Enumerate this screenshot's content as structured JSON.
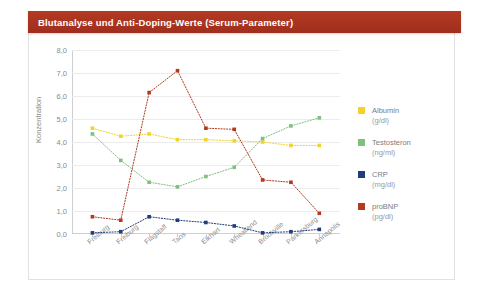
{
  "title": "Blutanalyse und Anti-Doping-Werte (Serum-Parameter)",
  "colors": {
    "title_bar": "#a93320",
    "albumin": "#f2d32e",
    "testosteron": "#7fc07f",
    "crp": "#1f3d7a",
    "probnp": "#b23a1e",
    "grid": "#ececec",
    "axis": "#cfcfcf",
    "tick_text": "#8a8a8a"
  },
  "legend": {
    "items": [
      {
        "label": "Albumin",
        "unit": "(g/dl)",
        "color": "#f2d32e",
        "swatch": "legend-swatch-albumin"
      },
      {
        "label": "Testosteron",
        "unit": "(ng/ml)",
        "color": "#7fc07f",
        "swatch": "legend-swatch-testosteron"
      },
      {
        "label": "CRP",
        "unit": "(mg/dl)",
        "color": "#1f3d7a",
        "swatch": "legend-swatch-crp"
      },
      {
        "label": "proBNP",
        "unit": "(pg/dl)",
        "color": "#b23a1e",
        "swatch": "legend-swatch-probnp"
      }
    ]
  },
  "chart_data": {
    "type": "line",
    "title": "Blutanalyse und Anti-Doping-Werte (Serum-Parameter)",
    "xlabel": "",
    "ylabel": "Konzentration",
    "ylim": [
      0,
      8
    ],
    "yticks": [
      0,
      1,
      2,
      3,
      4,
      5,
      6,
      7,
      8
    ],
    "ytick_labels": [
      "0,0",
      "1,0",
      "2,0",
      "3,0",
      "4,0",
      "5,0",
      "6,0",
      "7,0",
      "8,0"
    ],
    "grid": true,
    "legend_position": "right",
    "marker": "square",
    "linestyle": "dotted",
    "categories": [
      "Freiburg",
      "Freiburg",
      "Flagstaff",
      "Taos",
      "Elkhart",
      "Wheatland",
      "Brookville",
      "Parkersburg",
      "Annapolis"
    ],
    "series": [
      {
        "name": "Albumin",
        "unit": "(g/dl)",
        "color": "#f2d32e",
        "values": [
          4.6,
          4.25,
          4.35,
          4.1,
          4.1,
          4.05,
          4.0,
          3.85,
          3.85
        ]
      },
      {
        "name": "Testosteron",
        "unit": "(ng/ml)",
        "color": "#7fc07f",
        "values": [
          4.35,
          3.2,
          2.25,
          2.05,
          2.5,
          2.9,
          4.15,
          4.7,
          5.05
        ]
      },
      {
        "name": "CRP",
        "unit": "(mg/dl)",
        "color": "#1f3d7a",
        "values": [
          0.05,
          0.1,
          0.75,
          0.6,
          0.5,
          0.35,
          0.05,
          0.1,
          0.2
        ]
      },
      {
        "name": "proBNP",
        "unit": "(pg/dl)",
        "color": "#b23a1e",
        "values": [
          0.75,
          0.6,
          6.15,
          7.1,
          4.6,
          4.55,
          2.35,
          2.25,
          0.9
        ]
      }
    ]
  }
}
